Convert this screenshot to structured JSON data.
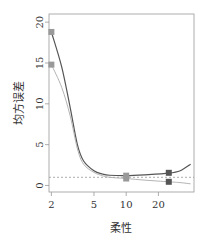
{
  "chart_data": {
    "type": "line",
    "title": "",
    "xlabel": "柔性",
    "ylabel": "均方误差",
    "xscale": "log",
    "xlim": [
      1.9,
      43
    ],
    "ylim": [
      -0.8,
      21
    ],
    "xticks": [
      2,
      5,
      10,
      20
    ],
    "xtick_labels": [
      "2",
      "5",
      "10",
      "20"
    ],
    "yticks": [
      0,
      5,
      10,
      15,
      20
    ],
    "ytick_labels": [
      "0",
      "5",
      "10",
      "15",
      "20"
    ],
    "grid": false,
    "reference_line": {
      "y": 1.0,
      "style": "dashed",
      "color": "#999999"
    },
    "series": [
      {
        "name": "test-mse",
        "color": "#555555",
        "curve": [
          [
            2,
            18.8
          ],
          [
            2.5,
            14.5
          ],
          [
            3,
            9.5
          ],
          [
            3.5,
            5.0
          ],
          [
            4,
            3.0
          ],
          [
            5,
            1.8
          ],
          [
            6,
            1.4
          ],
          [
            7,
            1.25
          ],
          [
            10,
            1.2
          ],
          [
            15,
            1.3
          ],
          [
            25,
            1.5
          ],
          [
            32,
            1.8
          ],
          [
            40,
            2.6
          ]
        ],
        "markers": [
          [
            2,
            18.8
          ],
          [
            10,
            1.2
          ],
          [
            25,
            1.55
          ]
        ],
        "marker_colors": [
          "#999999",
          "#999999",
          "#555555"
        ]
      },
      {
        "name": "train-mse",
        "color": "#aaaaaa",
        "curve": [
          [
            2,
            14.8
          ],
          [
            2.5,
            12.0
          ],
          [
            3,
            8.5
          ],
          [
            3.5,
            4.5
          ],
          [
            4,
            2.6
          ],
          [
            5,
            1.6
          ],
          [
            6,
            1.2
          ],
          [
            7,
            1.0
          ],
          [
            10,
            0.85
          ],
          [
            15,
            0.65
          ],
          [
            25,
            0.45
          ],
          [
            32,
            0.35
          ],
          [
            40,
            0.2
          ]
        ],
        "markers": [
          [
            2,
            14.8
          ],
          [
            10,
            0.85
          ],
          [
            25,
            0.45
          ]
        ],
        "marker_colors": [
          "#999999",
          "#999999",
          "#555555"
        ]
      }
    ]
  }
}
